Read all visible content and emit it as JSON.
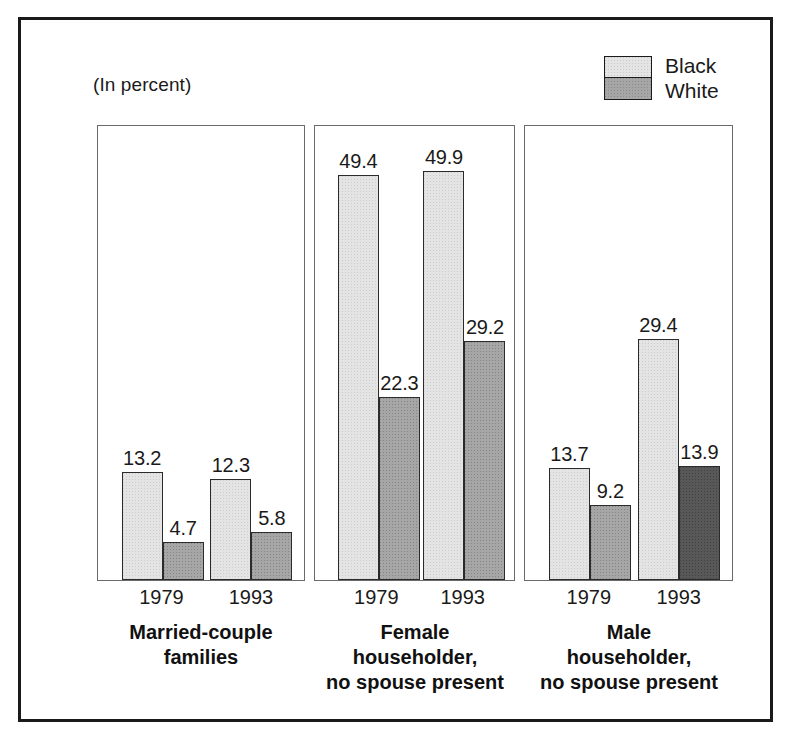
{
  "figure": {
    "unit_note": "(In percent)"
  },
  "legend": {
    "position": "top-right",
    "entries": [
      {
        "label": "Black",
        "color": "#e4e4e4",
        "series_key": "black"
      },
      {
        "label": "White",
        "color": "#a6a6a6",
        "series_key": "white"
      }
    ]
  },
  "chart_data": {
    "type": "bar",
    "title": "",
    "subtitle": "",
    "xlabel": "",
    "ylabel": "",
    "unit": "(In percent)",
    "ylim": [
      0,
      55
    ],
    "grid": false,
    "legend_position": "top-right",
    "categories": [
      "1979",
      "1993"
    ],
    "panels": [
      {
        "name": "Married-couple families",
        "caption_lines": [
          "Married-couple",
          "families"
        ],
        "categories": [
          "1979",
          "1993"
        ],
        "series": [
          {
            "name": "Black",
            "values": [
              13.2,
              12.3
            ]
          },
          {
            "name": "White",
            "values": [
              4.7,
              5.8
            ]
          }
        ]
      },
      {
        "name": "Female householder, no spouse present",
        "caption_lines": [
          "Female",
          "householder,",
          "no spouse present"
        ],
        "categories": [
          "1979",
          "1993"
        ],
        "series": [
          {
            "name": "Black",
            "values": [
              49.4,
              49.9
            ]
          },
          {
            "name": "White",
            "values": [
              22.3,
              29.2
            ]
          }
        ]
      },
      {
        "name": "Male householder, no spouse present",
        "caption_lines": [
          "Male",
          "householder,",
          "no spouse present"
        ],
        "categories": [
          "1979",
          "1993"
        ],
        "series": [
          {
            "name": "Black",
            "values": [
              13.7,
              29.4
            ]
          },
          {
            "name": "White",
            "values": [
              9.2,
              13.9
            ]
          }
        ]
      }
    ],
    "value_labels": {
      "panel_1": [
        "13.2",
        "4.7",
        "12.3",
        "5.8"
      ],
      "panel_2": [
        "49.4",
        "22.3",
        "49.9",
        "29.2"
      ],
      "panel_3": [
        "13.7",
        "9.2",
        "29.4",
        "13.9"
      ]
    }
  },
  "colors": {
    "frame": "#1a1a1a",
    "panel_border": "#6a6a6a",
    "bar_border": "#2b2b2b",
    "series_black": "#e4e4e4",
    "series_white": "#a6a6a6",
    "series_white_dark": "#585858",
    "text": "#1a1a1a",
    "background": "#ffffff"
  }
}
